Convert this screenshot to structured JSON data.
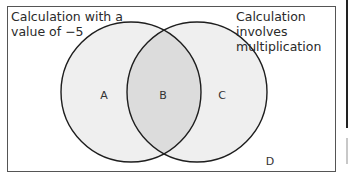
{
  "diagram": {
    "type": "venn",
    "sets": [
      {
        "id": "left",
        "title": "Calculation with a\nvalue of −5",
        "center": [
          131,
          92
        ],
        "radius": 70
      },
      {
        "id": "right",
        "title": "Calculation involves\nmultiplication",
        "center": [
          197,
          92
        ],
        "radius": 70
      }
    ],
    "regions": [
      {
        "label": "A",
        "description": "left set only",
        "x": 104,
        "y": 95
      },
      {
        "label": "B",
        "description": "intersection",
        "x": 163,
        "y": 95
      },
      {
        "label": "C",
        "description": "right set only",
        "x": 222,
        "y": 95
      },
      {
        "label": "D",
        "description": "outside both sets",
        "x": 270,
        "y": 161
      }
    ],
    "colors": {
      "set_fill": "#efefef",
      "intersection_fill": "#dcdcdc",
      "outline": "#1e1e1e",
      "frame": "#555555",
      "background": "#ffffff"
    }
  }
}
